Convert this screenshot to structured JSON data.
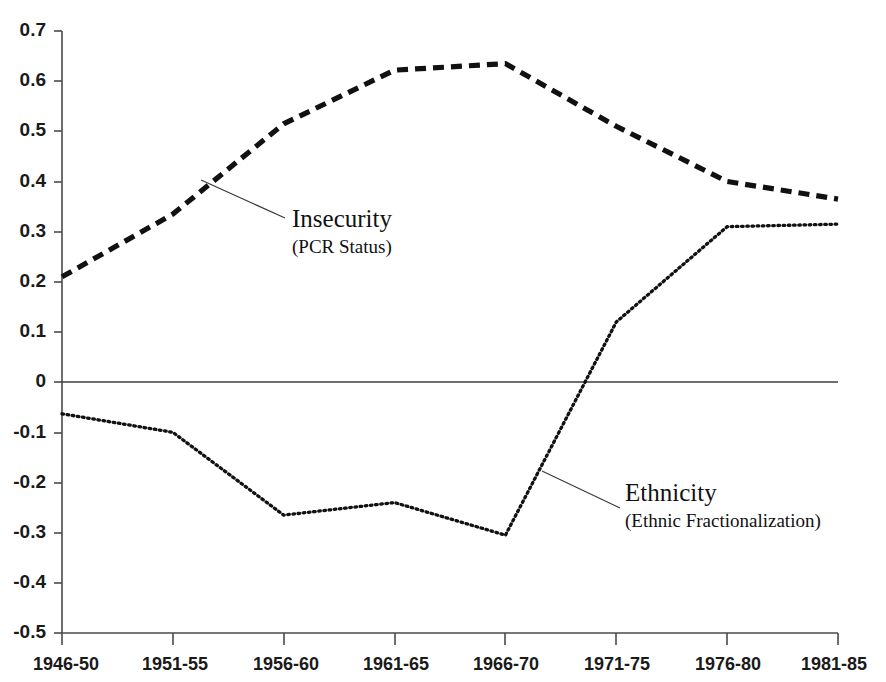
{
  "chart_data": {
    "type": "line",
    "title": "",
    "subtitle": "",
    "xlabel": "",
    "ylabel": "",
    "categories": [
      "1946-50",
      "1951-55",
      "1956-60",
      "1961-65",
      "1966-70",
      "1971-75",
      "1976-80",
      "1981-85"
    ],
    "ylim": [
      -0.5,
      0.7
    ],
    "yticks": [
      "0.7",
      "0.6",
      "0.5",
      "0.4",
      "0.3",
      "0.2",
      "0.1",
      "0",
      "-0.1",
      "-0.2",
      "-0.3",
      "-0.4",
      "-0.5"
    ],
    "ytick_values": [
      0.7,
      0.6,
      0.5,
      0.4,
      0.3,
      0.2,
      0.1,
      0.0,
      -0.1,
      -0.2,
      -0.3,
      -0.4,
      -0.5
    ],
    "grid": false,
    "legend_position": "inline-annotations",
    "zero_reference_line": true,
    "series": [
      {
        "name": "Insecurity",
        "sublabel": "(PCR Status)",
        "style": "dashed",
        "color": "#111111",
        "values": [
          0.21,
          0.335,
          0.515,
          0.622,
          0.635,
          0.51,
          0.4,
          0.365
        ]
      },
      {
        "name": "Ethnicity",
        "sublabel": "(Ethnic Fractionalization)",
        "style": "dotted",
        "color": "#111111",
        "values": [
          -0.063,
          -0.1,
          -0.265,
          -0.24,
          -0.305,
          0.12,
          0.31,
          0.315
        ]
      }
    ],
    "annotations": [
      {
        "label": "Insecurity",
        "sublabel": "(PCR Status)",
        "anchor_category": "1956-60",
        "anchor_value": 0.415,
        "text_x": 292,
        "text_y": 227,
        "leader_from_x": 201,
        "leader_from_y": 180,
        "leader_to_x": 285,
        "leader_to_y": 218
      },
      {
        "label": "Ethnicity",
        "sublabel": "(Ethnic Fractionalization)",
        "anchor_category": "1971-75",
        "anchor_value": -0.185,
        "text_x": 625,
        "text_y": 501,
        "leader_from_x": 542,
        "leader_from_y": 471,
        "leader_to_x": 620,
        "leader_to_y": 508
      }
    ]
  }
}
